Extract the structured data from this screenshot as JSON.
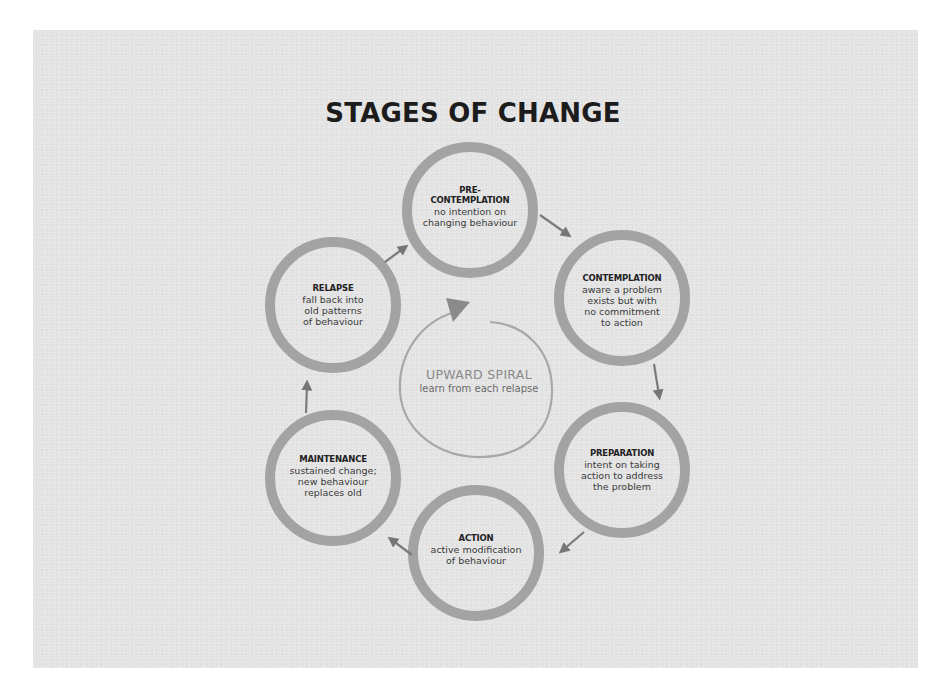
{
  "title": "STAGES OF CHANGE",
  "colors": {
    "background": "#ffffff",
    "panel": "#e4e4e4",
    "ring": "#a3a3a3",
    "arrow": "#7a7a7a",
    "spiral": "#a8a8a8",
    "title_text": "#1c1c1c"
  },
  "stages": [
    {
      "name": "PRE-\nCONTEMPLATION",
      "name_line1": "PRE-",
      "name_line2": "CONTEMPLATION",
      "description": "no intention on changing behaviour",
      "desc_lines": [
        "no intention on",
        "changing behaviour"
      ]
    },
    {
      "name": "CONTEMPLATION",
      "name_line1": "CONTEMPLATION",
      "description": "aware a problem exists but with no commitment to action",
      "desc_lines": [
        "aware a problem",
        "exists but with",
        "no commitment",
        "to action"
      ]
    },
    {
      "name": "PREPARATION",
      "name_line1": "PREPARATION",
      "description": "intent on taking action to address the problem",
      "desc_lines": [
        "intent on taking",
        "action to address",
        "the problem"
      ]
    },
    {
      "name": "ACTION",
      "name_line1": "ACTION",
      "description": "active modification of behaviour",
      "desc_lines": [
        "active modification",
        "of behaviour"
      ]
    },
    {
      "name": "MAINTENANCE",
      "name_line1": "MAINTENANCE",
      "description": "sustained change; new behaviour replaces old",
      "desc_lines": [
        "sustained change;",
        "new behaviour",
        "replaces old"
      ]
    },
    {
      "name": "RELAPSE",
      "name_line1": "RELAPSE",
      "description": "fall back into old patterns of behaviour",
      "desc_lines": [
        "fall back into",
        "old patterns",
        "of behaviour"
      ]
    }
  ],
  "center": {
    "title": "UPWARD SPIRAL",
    "subtitle": "learn from each relapse"
  },
  "flow": [
    "PRE-CONTEMPLATION -> CONTEMPLATION",
    "CONTEMPLATION -> PREPARATION",
    "PREPARATION -> ACTION",
    "ACTION -> MAINTENANCE",
    "MAINTENANCE -> RELAPSE",
    "RELAPSE -> PRE-CONTEMPLATION"
  ]
}
